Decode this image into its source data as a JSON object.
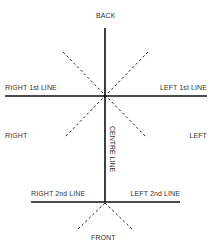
{
  "diagram": {
    "title": "",
    "labels": {
      "back": "BACK",
      "front": "FRONT",
      "right": "RIGHT",
      "left": "LEFT",
      "right_1st_line": "RIGHT 1st LINE",
      "left_1st_line": "LEFT 1st LINE",
      "right_2nd_line": "RIGHT 2nd LINE",
      "left_2nd_line": "LEFT 2nd LINE",
      "centre_line": "CENTRE LINE"
    },
    "colors": {
      "line": "#111111",
      "text": "#333333"
    }
  }
}
